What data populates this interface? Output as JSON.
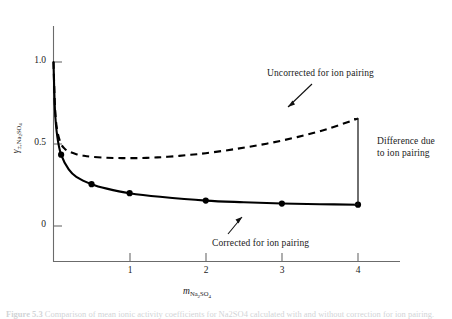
{
  "figure": {
    "caption_prefix": "Figure 5.3",
    "caption_text": "Comparison of mean ionic activity coefficients for Na2SO4 calculated with and without correction for ion pairing."
  },
  "axes": {
    "x": {
      "label_main": "m",
      "label_sub": "Na",
      "label_sub_2": "2",
      "label_sub_3": "SO",
      "label_sub_4": "4",
      "ticks": [
        "1",
        "2",
        "3",
        "4"
      ],
      "tick_values": [
        1,
        2,
        3,
        4
      ],
      "min": 0,
      "max": 4.55
    },
    "y": {
      "label_main": "γ",
      "label_sub_pm": "±,",
      "label_sub": "Na",
      "label_sub_2": "2",
      "label_sub_3": "SO",
      "label_sub_4": "4",
      "ticks": [
        "0",
        "0.5",
        "1.0"
      ],
      "tick_values": [
        0,
        0.5,
        1.0
      ],
      "min": -0.19,
      "max": 1.17
    }
  },
  "annotations": {
    "uncorrected": "Uncorrected for ion pairing",
    "corrected": "Corrected for ion pairing",
    "difference_line1": "Difference due",
    "difference_line2": "to ion pairing"
  },
  "colors": {
    "curve": "#000000",
    "axis": "#6b6b6b",
    "text": "#1a1a1a",
    "background": "#ffffff"
  },
  "chart_data": {
    "type": "line",
    "title": "",
    "xlabel": "m_Na2SO4",
    "ylabel": "gamma_pm,Na2SO4",
    "xlim": [
      0,
      4.55
    ],
    "ylim": [
      -0.19,
      1.17
    ],
    "grid": false,
    "legend": "annotations",
    "series": [
      {
        "name": "Uncorrected for ion pairing",
        "style": "dashed",
        "marker": "none",
        "x": [
          0.0,
          0.02,
          0.05,
          0.1,
          0.15,
          0.2,
          0.3,
          0.4,
          0.5,
          0.7,
          0.9,
          1.1,
          1.3,
          1.5,
          1.8,
          2.0,
          2.4,
          2.8,
          3.2,
          3.6,
          4.0
        ],
        "y": [
          1.0,
          0.72,
          0.58,
          0.5,
          0.47,
          0.455,
          0.438,
          0.428,
          0.422,
          0.416,
          0.414,
          0.414,
          0.417,
          0.422,
          0.434,
          0.444,
          0.47,
          0.502,
          0.542,
          0.592,
          0.655
        ]
      },
      {
        "name": "Corrected for ion pairing",
        "style": "solid",
        "marker": "filled-circle",
        "x": [
          0.0,
          0.02,
          0.05,
          0.1,
          0.2,
          0.3,
          0.5,
          0.7,
          1.0,
          1.4,
          2.0,
          2.5,
          3.0,
          3.5,
          4.0
        ],
        "y": [
          1.0,
          0.7,
          0.545,
          0.435,
          0.345,
          0.3,
          0.255,
          0.228,
          0.2,
          0.178,
          0.155,
          0.145,
          0.137,
          0.133,
          0.13
        ]
      }
    ],
    "markers": {
      "series": "Corrected for ion pairing",
      "points": [
        {
          "x": 0.1,
          "y": 0.435
        },
        {
          "x": 0.5,
          "y": 0.255
        },
        {
          "x": 1.0,
          "y": 0.2
        },
        {
          "x": 2.0,
          "y": 0.155
        },
        {
          "x": 3.0,
          "y": 0.137
        },
        {
          "x": 4.0,
          "y": 0.13
        }
      ]
    },
    "difference_bracket": {
      "x": 4.0,
      "y_top": 0.655,
      "y_bottom": 0.13,
      "label": "Difference due to ion pairing"
    }
  }
}
